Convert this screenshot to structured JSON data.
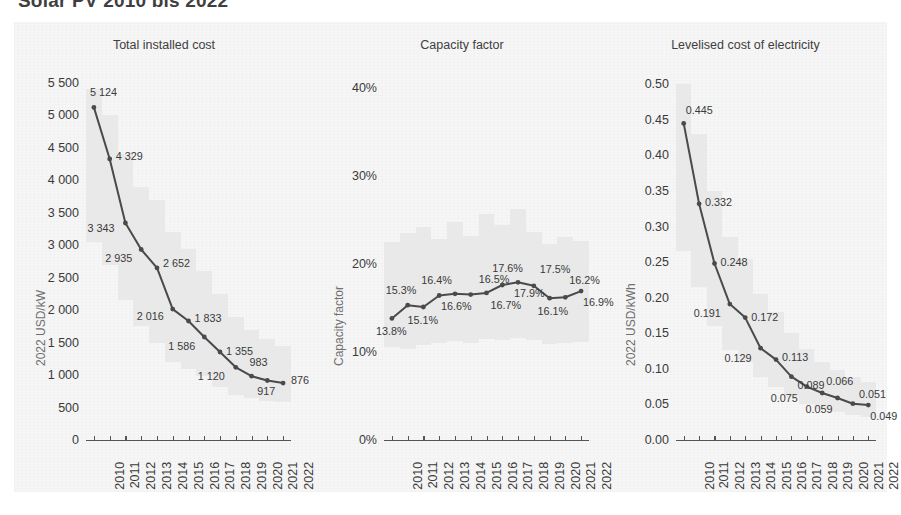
{
  "title": "Solar PV 2010 bis 2022",
  "chart_data": [
    {
      "type": "line",
      "title": "Total installed cost",
      "ylabel": "2022 USD/kW",
      "xlabel": "",
      "categories": [
        "2010",
        "2011",
        "2012",
        "2013",
        "2014",
        "2015",
        "2016",
        "2017",
        "2018",
        "2019",
        "2020",
        "2021",
        "2022"
      ],
      "values": [
        5124,
        4329,
        3343,
        2935,
        2652,
        2016,
        1833,
        1586,
        1355,
        1120,
        983,
        917,
        876
      ],
      "value_labels": [
        "5 124",
        "4 329",
        "3 343",
        "2 935",
        "2 652",
        "2 016",
        "1 833",
        "1 586",
        "1 355",
        "1 120",
        "983",
        "917",
        "876"
      ],
      "yticks": [
        0,
        500,
        1000,
        1500,
        2000,
        2500,
        3000,
        3500,
        4000,
        4500,
        5000,
        5500
      ],
      "ytick_labels": [
        "0",
        "500",
        "1 000",
        "1 500",
        "2 000",
        "2 500",
        "3 000",
        "3 500",
        "4 000",
        "4 500",
        "5 000",
        "5 500"
      ],
      "ylim": [
        0,
        5700
      ],
      "grid": false,
      "band_low": [
        3050,
        2700,
        2150,
        1750,
        1500,
        1200,
        1100,
        980,
        820,
        700,
        640,
        600,
        580
      ],
      "band_high": [
        5400,
        5000,
        4400,
        3900,
        3700,
        3200,
        2950,
        2600,
        2250,
        1900,
        1700,
        1550,
        1450
      ]
    },
    {
      "type": "line",
      "title": "Capacity factor",
      "ylabel": "Capacity factor",
      "xlabel": "",
      "categories": [
        "2010",
        "2011",
        "2012",
        "2013",
        "2014",
        "2015",
        "2016",
        "2017",
        "2018",
        "2019",
        "2020",
        "2021",
        "2022"
      ],
      "values": [
        13.8,
        15.3,
        15.1,
        16.4,
        16.6,
        16.5,
        16.7,
        17.6,
        17.9,
        17.5,
        16.1,
        16.2,
        16.9
      ],
      "value_labels": [
        "13.8%",
        "15.3%",
        "15.1%",
        "16.4%",
        "16.6%",
        "16.5%",
        "16.7%",
        "17.6%",
        "17.9%",
        "17.5%",
        "16.1%",
        "16.2%",
        "16.9%"
      ],
      "yticks": [
        0,
        10,
        20,
        30,
        40
      ],
      "ytick_labels": [
        "0%",
        "10%",
        "20%",
        "30%",
        "40%"
      ],
      "ylim": [
        0,
        42
      ],
      "grid": false,
      "band_low": [
        10.6,
        10.3,
        10.8,
        11.0,
        11.2,
        11.0,
        11.5,
        11.3,
        11.6,
        11.4,
        10.9,
        11.0,
        11.1
      ],
      "band_high": [
        22.5,
        23.5,
        24.2,
        22.8,
        24.8,
        23.2,
        25.6,
        24.4,
        26.2,
        23.6,
        22.2,
        23.0,
        22.6
      ]
    },
    {
      "type": "line",
      "title": "Levelised cost of electricity",
      "ylabel": "2022 USD/kWh",
      "xlabel": "",
      "categories": [
        "2010",
        "2011",
        "2012",
        "2013",
        "2014",
        "2015",
        "2016",
        "2017",
        "2018",
        "2019",
        "2020",
        "2021",
        "2022"
      ],
      "values": [
        0.445,
        0.332,
        0.248,
        0.191,
        0.172,
        0.129,
        0.113,
        0.089,
        0.075,
        0.066,
        0.059,
        0.051,
        0.049
      ],
      "value_labels": [
        "0.445",
        "0.332",
        "0.248",
        "0.191",
        "0.172",
        "0.129",
        "0.113",
        "0.089",
        "0.075",
        "0.066",
        "0.059",
        "0.051",
        "0.049"
      ],
      "yticks": [
        0,
        0.05,
        0.1,
        0.15,
        0.2,
        0.25,
        0.3,
        0.35,
        0.4,
        0.45,
        0.5
      ],
      "ytick_labels": [
        "0.00",
        "0.05",
        "0.10",
        "0.15",
        "0.20",
        "0.25",
        "0.30",
        "0.35",
        "0.40",
        "0.45",
        "0.50"
      ],
      "ylim": [
        0,
        0.52
      ],
      "grid": false,
      "band_low": [
        0.265,
        0.215,
        0.16,
        0.126,
        0.11,
        0.088,
        0.074,
        0.06,
        0.05,
        0.044,
        0.04,
        0.035,
        0.033
      ],
      "band_high": [
        0.5,
        0.43,
        0.35,
        0.285,
        0.255,
        0.205,
        0.18,
        0.15,
        0.128,
        0.11,
        0.098,
        0.088,
        0.082
      ]
    }
  ],
  "colors": {
    "line": "#4a4a4a",
    "band": "#e6e6e6",
    "panel_bg": "#f6f6f6",
    "text": "#3a3a3a",
    "axis_label": "#6f6f6f"
  }
}
